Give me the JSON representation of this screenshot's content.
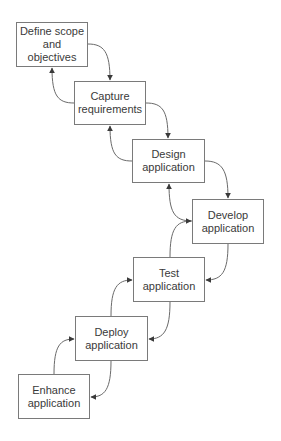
{
  "diagram": {
    "type": "waterfall-process",
    "colors": {
      "stroke": "#6a6a6a",
      "box_border": "#7a7a7a",
      "text": "#3a3a3a",
      "background": "#ffffff"
    },
    "steps": [
      {
        "id": "define",
        "label": "Define scope\nand objectives",
        "x": 16,
        "y": 22,
        "w": 72,
        "h": 45
      },
      {
        "id": "capture",
        "label": "Capture\nrequirements",
        "x": 74,
        "y": 81,
        "w": 72,
        "h": 44
      },
      {
        "id": "design",
        "label": "Design\napplication",
        "x": 132,
        "y": 139,
        "w": 73,
        "h": 44
      },
      {
        "id": "develop",
        "label": "Develop\napplication",
        "x": 192,
        "y": 199,
        "w": 72,
        "h": 45
      },
      {
        "id": "test",
        "label": "Test\napplication",
        "x": 133,
        "y": 257,
        "w": 72,
        "h": 45
      },
      {
        "id": "deploy",
        "label": "Deploy\napplication",
        "x": 75,
        "y": 316,
        "w": 73,
        "h": 45
      },
      {
        "id": "enhance",
        "label": "Enhance\napplication",
        "x": 18,
        "y": 374,
        "w": 72,
        "h": 45
      }
    ],
    "connections": [
      {
        "from": "define",
        "to": "capture",
        "direction": "forward"
      },
      {
        "from": "capture",
        "to": "define",
        "direction": "back"
      },
      {
        "from": "capture",
        "to": "design",
        "direction": "forward"
      },
      {
        "from": "design",
        "to": "capture",
        "direction": "back"
      },
      {
        "from": "design",
        "to": "develop",
        "direction": "forward"
      },
      {
        "from": "develop",
        "to": "design",
        "direction": "back"
      },
      {
        "from": "develop",
        "to": "test",
        "direction": "forward"
      },
      {
        "from": "test",
        "to": "develop",
        "direction": "back"
      },
      {
        "from": "test",
        "to": "deploy",
        "direction": "forward"
      },
      {
        "from": "deploy",
        "to": "test",
        "direction": "back"
      },
      {
        "from": "deploy",
        "to": "enhance",
        "direction": "forward"
      },
      {
        "from": "enhance",
        "to": "deploy",
        "direction": "back"
      }
    ]
  }
}
